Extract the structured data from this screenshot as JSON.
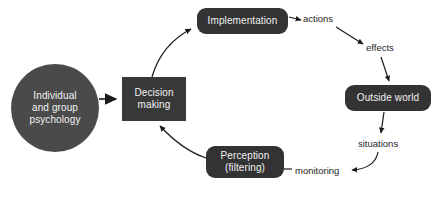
{
  "diagram": {
    "background_color": "#ffffff",
    "node_fill_circle": "#4a4a4a",
    "node_fill_rect": "#383838",
    "node_fill_rounded": "#333333",
    "node_text_color": "#f2f2f2",
    "edge_color": "#1a1a1a",
    "label_text_color": "#262626",
    "nodes": [
      {
        "id": "psychology",
        "label": "Individual\nand group\npsychology",
        "line1": "Individual",
        "line2": "and group",
        "line3": "psychology",
        "shape": "circle",
        "x": 11,
        "y": 64,
        "w": 88,
        "h": 88
      },
      {
        "id": "decision",
        "label": "Decision\nmaking",
        "line1": "Decision",
        "line2": "making",
        "shape": "rect",
        "x": 122,
        "y": 77,
        "w": 64,
        "h": 44
      },
      {
        "id": "implementation",
        "label": "Implementation",
        "shape": "rounded",
        "x": 197,
        "y": 8,
        "w": 91,
        "h": 26
      },
      {
        "id": "outside-world",
        "label": "Outside world",
        "shape": "rounded",
        "x": 345,
        "y": 85,
        "w": 86,
        "h": 26
      },
      {
        "id": "perception",
        "label": "Perception\n(filtering)",
        "line1": "Perception",
        "line2": "(filtering)",
        "shape": "rounded",
        "x": 206,
        "y": 146,
        "w": 78,
        "h": 32
      }
    ],
    "edges": [
      {
        "id": "psychology-to-decision",
        "label": "",
        "from": "psychology",
        "to": "decision",
        "style": "straight"
      },
      {
        "id": "decision-to-implementation",
        "label": "",
        "from": "decision",
        "to": "implementation",
        "style": "curved"
      },
      {
        "id": "implementation-to-actions",
        "label": "actions",
        "from": "implementation",
        "to": "actions-label",
        "style": "straight"
      },
      {
        "id": "actions-to-effects",
        "label": "effects",
        "from": "actions-label",
        "to": "effects-label",
        "style": "straight"
      },
      {
        "id": "effects-to-outside-world",
        "label": "",
        "from": "effects-label",
        "to": "outside-world",
        "style": "straight"
      },
      {
        "id": "outside-world-to-situations",
        "label": "situations",
        "from": "outside-world",
        "to": "situations-label",
        "style": "straight"
      },
      {
        "id": "situations-to-monitoring",
        "label": "monitoring",
        "from": "situations-label",
        "to": "monitoring-label",
        "style": "curved"
      },
      {
        "id": "monitoring-to-perception",
        "label": "",
        "from": "monitoring-label",
        "to": "perception",
        "style": "straight"
      },
      {
        "id": "perception-to-decision",
        "label": "",
        "from": "perception",
        "to": "decision",
        "style": "curved"
      }
    ],
    "edge_labels": [
      {
        "id": "actions-label",
        "text": "actions",
        "x": 303,
        "y": 13
      },
      {
        "id": "effects-label",
        "text": "effects",
        "x": 366,
        "y": 42
      },
      {
        "id": "situations-label",
        "text": "situations",
        "x": 358,
        "y": 138
      },
      {
        "id": "monitoring-label",
        "text": "monitoring",
        "x": 295,
        "y": 165
      }
    ],
    "caption": ""
  }
}
